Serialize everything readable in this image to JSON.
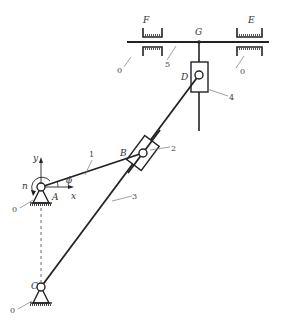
{
  "diagram": {
    "type": "mechanism kinematic diagram",
    "joint_labels": {
      "A": "A",
      "B": "B",
      "C": "C",
      "D": "D",
      "E": "E",
      "F": "F",
      "G": "G"
    },
    "link_labels": {
      "l1": "1",
      "l2": "2",
      "l3": "3",
      "l4": "4",
      "l5": "5"
    },
    "ground_labels": {
      "gA": "0",
      "gC": "0",
      "gF": "0",
      "gE": "0"
    },
    "axis_labels": {
      "x": "x",
      "y": "y"
    },
    "angle_label": "ϕ",
    "speed_label": "n",
    "colors": {
      "line": "#222222",
      "background": "#ffffff",
      "leader": "#777777"
    }
  }
}
